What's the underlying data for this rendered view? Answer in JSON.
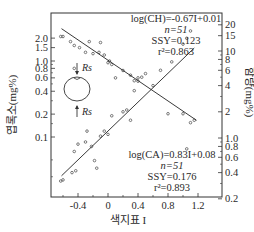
{
  "chart_data": {
    "type": "scatter",
    "title": "",
    "xlabel": "색지표 I",
    "ylabel_left": "엽록소(mg%)",
    "ylabel_right": "함량(mg%)",
    "x_ticks": [
      -0.4,
      0,
      0.4,
      0.8,
      1.2
    ],
    "x_tick_labels": [
      "-0.4",
      "0",
      "0.4",
      "0.8",
      "1.2"
    ],
    "xlim": [
      -0.75,
      1.25
    ],
    "y_left_scale": "log",
    "y_left_ticks": [
      0.1,
      0.2,
      0.4,
      0.6,
      0.8,
      1.0,
      1.5,
      2.0
    ],
    "y_left_tick_labels": [
      "0.1",
      "0.2",
      "0.4",
      "0.6",
      "0.8",
      "1.0",
      "1.5",
      "2.0"
    ],
    "y_right_scale": "log",
    "y_right_ticks": [
      0.2,
      0.4,
      0.6,
      0.8,
      1.0,
      2,
      4,
      6,
      8,
      10,
      15,
      20
    ],
    "y_right_tick_labels": [
      "0.2",
      "0.4",
      "0.6",
      "0.8",
      "1.0",
      "2",
      "4",
      "6",
      "8",
      "10",
      "15",
      "20"
    ],
    "grid": false,
    "legend": null,
    "series": [
      {
        "name": "CH (chlorophyll, left axis)",
        "fit": "log(CH)=-0.67I+0.01",
        "n": "n=51",
        "ss": "SSY=0.123",
        "r2": "r²=0.863",
        "points": [
          [
            -0.63,
            2.1
          ],
          [
            -0.6,
            2.1
          ],
          [
            -0.5,
            1.8
          ],
          [
            -0.45,
            1.6
          ],
          [
            -0.38,
            1.5
          ],
          [
            -0.3,
            1.3
          ],
          [
            -0.25,
            1.8
          ],
          [
            -0.2,
            1.25
          ],
          [
            -0.12,
            1.3
          ],
          [
            -0.1,
            1.75
          ],
          [
            -0.05,
            1.2
          ],
          [
            0.0,
            0.95
          ],
          [
            0.02,
            1.0
          ],
          [
            0.05,
            0.9
          ],
          [
            0.2,
            0.75
          ],
          [
            0.3,
            0.65
          ],
          [
            0.35,
            0.55
          ],
          [
            0.4,
            0.6
          ],
          [
            -0.45,
            0.8
          ],
          [
            0.1,
            0.6
          ]
        ]
      },
      {
        "name": "CA (carotenoid, right axis)",
        "fit": "log(CA)=0.83I+0.08",
        "n": "n=51",
        "ss": "SSY=0.176",
        "r2": "r²=0.893",
        "points": [
          [
            -0.63,
            0.32
          ],
          [
            -0.6,
            0.33
          ],
          [
            -0.48,
            0.4
          ],
          [
            -0.43,
            0.42
          ],
          [
            -0.45,
            0.7
          ],
          [
            -0.4,
            0.85
          ],
          [
            -0.3,
            0.9
          ],
          [
            -0.28,
            1.2
          ],
          [
            -0.22,
            0.8
          ],
          [
            -0.18,
            0.55
          ],
          [
            -0.15,
            0.45
          ],
          [
            -0.1,
            1.05
          ],
          [
            -0.05,
            1.2
          ],
          [
            0.0,
            1.1
          ],
          [
            0.05,
            1.8
          ],
          [
            0.2,
            2.0
          ],
          [
            0.25,
            2.1
          ],
          [
            0.3,
            1.6
          ],
          [
            0.35,
            3.5
          ],
          [
            0.4,
            4.5
          ],
          [
            0.45,
            5.0
          ],
          [
            0.5,
            5.5
          ],
          [
            0.6,
            4.0
          ],
          [
            0.7,
            6.0
          ],
          [
            0.85,
            7.5
          ],
          [
            1.0,
            12
          ],
          [
            1.05,
            14
          ],
          [
            1.1,
            17
          ],
          [
            1.0,
            1.9
          ],
          [
            1.1,
            1.5
          ],
          [
            1.15,
            1.6
          ],
          [
            0.8,
            1.9
          ],
          [
            1.05,
            0.75
          ]
        ]
      }
    ],
    "annotations": [
      "Rs",
      "Rs"
    ]
  },
  "labels": {
    "ch_fit": "log(CH)=-0.67I+0.01",
    "ch_n": "n=51",
    "ch_ss": "SSY=0.123",
    "ch_r2": "r²=0.863",
    "ca_fit": "log(CA)=0.83I+0.08",
    "ca_n": "n=51",
    "ca_ss": "SSY=0.176",
    "ca_r2": "r²=0.893",
    "rs_top": "Rs",
    "rs_bottom": "Rs"
  }
}
